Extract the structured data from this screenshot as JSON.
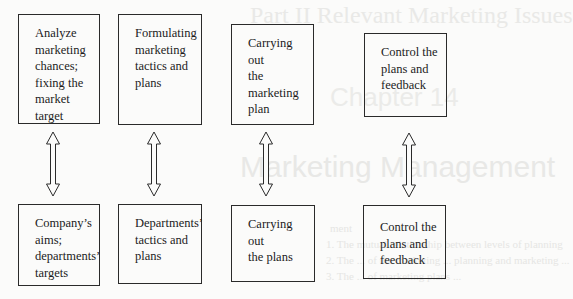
{
  "background_ghost_text": {
    "header": "Part II  Relevant Marketing Issues",
    "chapter": "Chapter 14",
    "title": "Marketing Management",
    "lines": [
      "ment",
      "1. The mutual relationship between levels of planning",
      "2. The ... of the marketing ... planning and marketing ...",
      "3. The ... of marketing plans ..."
    ]
  },
  "diagram": {
    "top_row": [
      {
        "id": "analyze",
        "text": "Analyze\nmarketing\nchances;\nfixing the\nmarket\ntarget"
      },
      {
        "id": "formulating",
        "text": "Formulating\nmarketing\ntactics and\nplans"
      },
      {
        "id": "carrying-marketing",
        "text": "Carrying out\nthe marketing\nplan"
      },
      {
        "id": "control-top",
        "text": "Control the\nplans and\nfeedback"
      }
    ],
    "bottom_row": [
      {
        "id": "company-aims",
        "text": "Company’s\naims;\ndepartments’\ntargets"
      },
      {
        "id": "departments-tactics",
        "text": "Departments’\ntactics and\nplans"
      },
      {
        "id": "carrying-plans",
        "text": "Carrying out\nthe plans"
      },
      {
        "id": "control-bottom",
        "text": "Control the\nplans and\nfeedback"
      }
    ],
    "connectors": [
      {
        "from": "analyze",
        "to": "company-aims",
        "type": "double-arrow"
      },
      {
        "from": "formulating",
        "to": "departments-tactics",
        "type": "double-arrow"
      },
      {
        "from": "carrying-marketing",
        "to": "carrying-plans",
        "type": "double-arrow"
      },
      {
        "from": "control-top",
        "to": "control-bottom",
        "type": "double-arrow"
      }
    ]
  },
  "colors": {
    "stroke": "#2a2a2a",
    "background": "#fbfbfa",
    "ghost_text": "#e8e8e6"
  }
}
